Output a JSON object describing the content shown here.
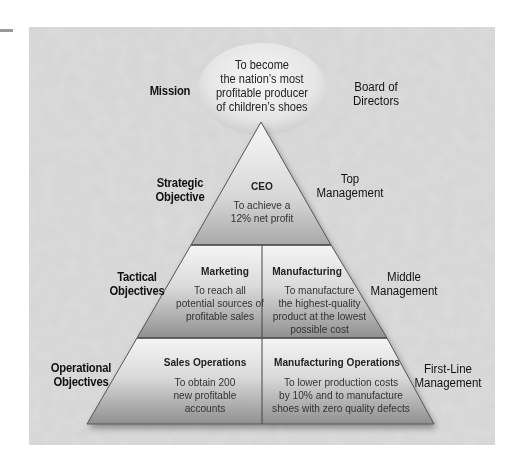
{
  "colors": {
    "panel_bg": "#c9c9c9",
    "ellipse_fill": "#e9e9e9",
    "tier_light": "#f4f4f4",
    "tier_dark": "#8f8f8f",
    "outline": "#555555",
    "accent_bar": "#9a9a9a"
  },
  "mission": {
    "level_label": "Mission",
    "statement_lines": [
      "To become",
      "the nation’s most",
      "profitable producer",
      "of children’s shoes"
    ],
    "owner_lines": [
      "Board of",
      "Directors"
    ]
  },
  "strategic": {
    "level_label_lines": [
      "Strategic",
      "Objective"
    ],
    "management_lines": [
      "Top",
      "Management"
    ],
    "cells": [
      {
        "title": "CEO",
        "text_lines": [
          "To achieve a",
          "12% net profit"
        ]
      }
    ]
  },
  "tactical": {
    "level_label_lines": [
      "Tactical",
      "Objectives"
    ],
    "management_lines": [
      "Middle",
      "Management"
    ],
    "cells": [
      {
        "title": "Marketing",
        "text_lines": [
          "To reach all",
          "potential sources of",
          "profitable sales"
        ]
      },
      {
        "title": "Manufacturing",
        "text_lines": [
          "To manufacture",
          "the highest-quality",
          "product at the lowest",
          "possible cost"
        ]
      }
    ]
  },
  "operational": {
    "level_label_lines": [
      "Operational",
      "Objectives"
    ],
    "management_lines": [
      "First-Line",
      "Management"
    ],
    "cells": [
      {
        "title": "Sales Operations",
        "text_lines": [
          "To obtain 200",
          "new profitable",
          "accounts"
        ]
      },
      {
        "title": "Manufacturing Operations",
        "text_lines": [
          "To lower production costs",
          "by 10% and to manufacture",
          "shoes with zero quality defects"
        ]
      }
    ]
  }
}
